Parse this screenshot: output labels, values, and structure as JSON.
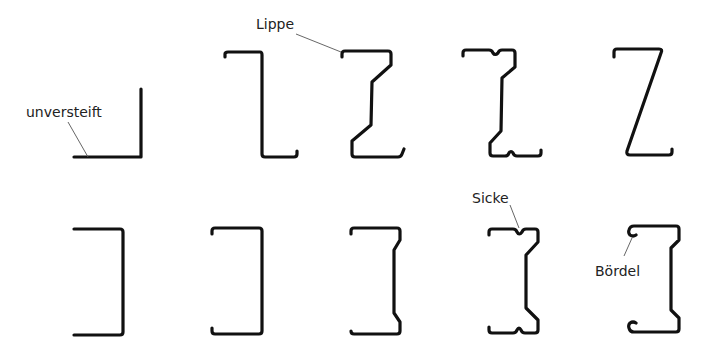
{
  "diagram": {
    "labels": {
      "unversteift": "unversteift",
      "lippe": "Lippe",
      "sicke": "Sicke",
      "boerdel": "Bördel"
    },
    "rows": [
      {
        "name": "top-row",
        "profiles": [
          "L-Winkel unversteift",
          "Z-Profil mit Lippe",
          "Z-Profil mit Lippe und Stegabkantung",
          "Z-Profil mit Lippe, Sicken und Stegabkantung",
          "Z-Profil schräg"
        ]
      },
      {
        "name": "bottom-row",
        "profiles": [
          "C-Profil unversteift",
          "C-Profil mit Lippe",
          "C-Profil mit Lippe und Stegabkantung",
          "C-Profil mit Lippe, Sicken und Stegabkantung",
          "C-Profil mit Bördel"
        ]
      }
    ],
    "colors": {
      "stroke": "#111111",
      "leader": "#555555",
      "text": "#222222",
      "background": "#ffffff"
    }
  }
}
